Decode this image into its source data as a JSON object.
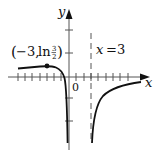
{
  "diagram": {
    "type": "function-graph",
    "axes": {
      "x_label": "x",
      "y_label": "y",
      "origin_label": "0"
    },
    "asymptote": {
      "label_var": "x",
      "label_eq": "=",
      "label_val": "3",
      "x": 3,
      "style": "dashed"
    },
    "point": {
      "label_open": "(",
      "label_x": "−3,",
      "label_fn": "ln",
      "label_num": "3",
      "label_den": "2",
      "label_close": ")",
      "x": -3,
      "y_expr": "ln 3/2"
    },
    "colors": {
      "curve": "#111111",
      "axis": "#555555",
      "background": "#ffffff"
    }
  }
}
